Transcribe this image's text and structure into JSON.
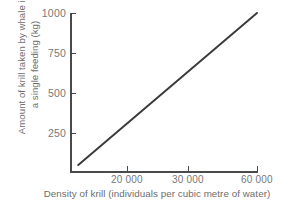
{
  "chart_data": {
    "type": "line",
    "title": "",
    "xlabel": "Density of krill (individuals per cubic metre of water)",
    "ylabel": "Amount of krill taken by whale in a single feeding (kg)",
    "ylabel_lines": [
      "Amount of krill taken by whale in",
      "a single feeding (kg)"
    ],
    "xtick_labels": [
      "20 000",
      "30 000",
      "60 000"
    ],
    "xtick_values": [
      20000,
      30000,
      60000
    ],
    "ytick_labels": [
      "250",
      "500",
      "750",
      "1000"
    ],
    "ytick_values": [
      250,
      500,
      750,
      1000
    ],
    "ylim": [
      0,
      1000
    ],
    "grid": false,
    "legend": false,
    "series": [
      {
        "name": "krill taken by whale",
        "x": [
          5000,
          60000
        ],
        "y": [
          50,
          1000
        ],
        "points": [
          {
            "x": 5000,
            "y": 50
          },
          {
            "x": 60000,
            "y": 1000
          }
        ],
        "color": "#3b3b3b",
        "linewidth": 2
      }
    ]
  },
  "axes": {
    "y_ticks": [
      {
        "label": "1000",
        "top": 13
      },
      {
        "label": "750",
        "top": 53
      },
      {
        "label": "500",
        "top": 93
      },
      {
        "label": "250",
        "top": 133
      }
    ],
    "x_ticks": [
      {
        "label": "20 000",
        "left": 127
      },
      {
        "label": "30 000",
        "left": 188
      },
      {
        "label": "60 000",
        "left": 257
      }
    ],
    "spine_color": "#4a4a4a",
    "tick_label_color": "#787878",
    "title_color": "#6e6e6e",
    "background": "#ffffff"
  }
}
